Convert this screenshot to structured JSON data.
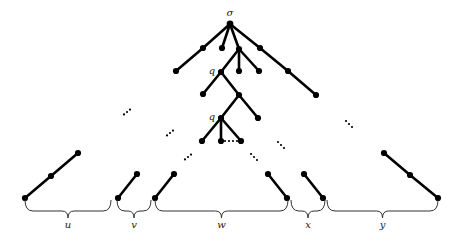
{
  "diagram": {
    "type": "tree",
    "root_label": "σ",
    "node_labels": {
      "q_upper": "q",
      "q_lower": "q"
    },
    "nodes": [
      {
        "id": "root",
        "x": 230,
        "y": 24
      },
      {
        "id": "a1",
        "x": 203,
        "y": 48
      },
      {
        "id": "a2",
        "x": 176,
        "y": 71
      },
      {
        "id": "b1",
        "x": 222,
        "y": 48
      },
      {
        "id": "c",
        "x": 239,
        "y": 49
      },
      {
        "id": "q1",
        "x": 221,
        "y": 72
      },
      {
        "id": "c2",
        "x": 239,
        "y": 71
      },
      {
        "id": "c3",
        "x": 259,
        "y": 71
      },
      {
        "id": "d1",
        "x": 260,
        "y": 48
      },
      {
        "id": "d2",
        "x": 288,
        "y": 71
      },
      {
        "id": "d3",
        "x": 316,
        "y": 95
      },
      {
        "id": "e1",
        "x": 203,
        "y": 94
      },
      {
        "id": "e2",
        "x": 239,
        "y": 95
      },
      {
        "id": "q2",
        "x": 221,
        "y": 118
      },
      {
        "id": "f2",
        "x": 258,
        "y": 118
      },
      {
        "id": "g1",
        "x": 202,
        "y": 141
      },
      {
        "id": "g2",
        "x": 221,
        "y": 141
      },
      {
        "id": "g3",
        "x": 241,
        "y": 141
      },
      {
        "id": "u1",
        "x": 25,
        "y": 198
      },
      {
        "id": "u2",
        "x": 51,
        "y": 176
      },
      {
        "id": "u3",
        "x": 78,
        "y": 153
      },
      {
        "id": "v1",
        "x": 118,
        "y": 198
      },
      {
        "id": "v2",
        "x": 137,
        "y": 174
      },
      {
        "id": "w1",
        "x": 155,
        "y": 198
      },
      {
        "id": "w2",
        "x": 174,
        "y": 174
      },
      {
        "id": "w3",
        "x": 268,
        "y": 174
      },
      {
        "id": "w4",
        "x": 287,
        "y": 198
      },
      {
        "id": "x1",
        "x": 304,
        "y": 174
      },
      {
        "id": "x2",
        "x": 323,
        "y": 198
      },
      {
        "id": "y1",
        "x": 384,
        "y": 153
      },
      {
        "id": "y2",
        "x": 410,
        "y": 175
      },
      {
        "id": "y3",
        "x": 438,
        "y": 198
      }
    ],
    "edges": [
      [
        "root",
        "a1"
      ],
      [
        "a1",
        "a2"
      ],
      [
        "root",
        "b1"
      ],
      [
        "root",
        "c"
      ],
      [
        "root",
        "d1"
      ],
      [
        "d1",
        "d2"
      ],
      [
        "d2",
        "d3"
      ],
      [
        "c",
        "q1"
      ],
      [
        "c",
        "c2"
      ],
      [
        "c",
        "c3"
      ],
      [
        "q1",
        "e1"
      ],
      [
        "q1",
        "e2"
      ],
      [
        "e2",
        "q2"
      ],
      [
        "e2",
        "f2"
      ],
      [
        "q2",
        "g1"
      ],
      [
        "q2",
        "g2"
      ],
      [
        "q2",
        "g3"
      ],
      [
        "u1",
        "u2"
      ],
      [
        "u2",
        "u3"
      ],
      [
        "v1",
        "v2"
      ],
      [
        "w1",
        "w2"
      ],
      [
        "w3",
        "w4"
      ],
      [
        "x1",
        "x2"
      ],
      [
        "y1",
        "y2"
      ],
      [
        "y2",
        "y3"
      ]
    ],
    "ellipses": [
      {
        "x": 127,
        "y": 112,
        "dir": "up"
      },
      {
        "x": 170,
        "y": 133,
        "dir": "up"
      },
      {
        "x": 188,
        "y": 157,
        "dir": "up"
      },
      {
        "x": 254,
        "y": 157,
        "dir": "down"
      },
      {
        "x": 281,
        "y": 145,
        "dir": "down"
      },
      {
        "x": 349,
        "y": 124,
        "dir": "down"
      },
      {
        "x": 231,
        "y": 141,
        "dir": "horizontal"
      }
    ],
    "braces": [
      {
        "label": "u",
        "x1": 25,
        "x2": 111
      },
      {
        "label": "v",
        "x1": 117,
        "x2": 151
      },
      {
        "label": "w",
        "x1": 155,
        "x2": 288
      },
      {
        "label": "x",
        "x1": 291,
        "x2": 325
      },
      {
        "label": "y",
        "x1": 327,
        "x2": 438
      }
    ]
  }
}
